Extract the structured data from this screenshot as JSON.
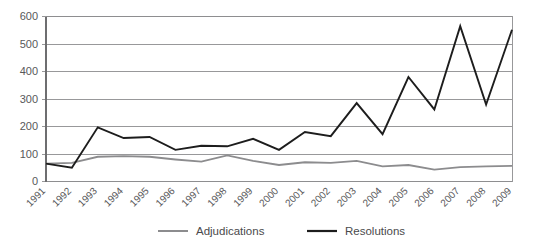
{
  "chart_data": {
    "type": "line",
    "title": "",
    "xlabel": "",
    "ylabel": "",
    "ylim": [
      0,
      600
    ],
    "ytick_step": 100,
    "grid": true,
    "legend_position": "bottom",
    "categories": [
      "1991",
      "1992",
      "1993",
      "1994",
      "1995",
      "1996",
      "1997",
      "1998",
      "1999",
      "2000",
      "2001",
      "2002",
      "2003",
      "2004",
      "2005",
      "2006",
      "2007",
      "2008",
      "2009"
    ],
    "ytick_labels": [
      "0",
      "100",
      "200",
      "300",
      "400",
      "500",
      "600"
    ],
    "series": [
      {
        "name": "Adjudications",
        "color": "#8c8c8e",
        "values": [
          65,
          68,
          90,
          92,
          90,
          80,
          72,
          95,
          75,
          60,
          70,
          68,
          75,
          55,
          60,
          43,
          52,
          55,
          57
        ]
      },
      {
        "name": "Resolutions",
        "color": "#1d1d1d",
        "values": [
          65,
          50,
          197,
          158,
          162,
          115,
          130,
          128,
          155,
          115,
          180,
          165,
          285,
          172,
          380,
          262,
          565,
          280,
          552
        ]
      }
    ]
  },
  "legend": {
    "items": [
      {
        "label": "Adjudications",
        "color": "#8c8c8e"
      },
      {
        "label": "Resolutions",
        "color": "#1d1d1d"
      }
    ]
  }
}
